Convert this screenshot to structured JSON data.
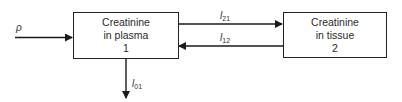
{
  "diagram": {
    "compartments": [
      {
        "id": 1,
        "line1": "Creatinine",
        "line2": "in plasma",
        "number": "1"
      },
      {
        "id": 2,
        "line1": "Creatinine",
        "line2": "in tissue",
        "number": "2"
      }
    ],
    "flows": {
      "input": {
        "symbol": "ρ",
        "to": 1
      },
      "l21": {
        "base": "l",
        "sub": "21",
        "from": 1,
        "to": 2
      },
      "l12": {
        "base": "l",
        "sub": "12",
        "from": 2,
        "to": 1
      },
      "l01": {
        "base": "l",
        "sub": "01",
        "from": 1,
        "to": "outside"
      }
    }
  }
}
